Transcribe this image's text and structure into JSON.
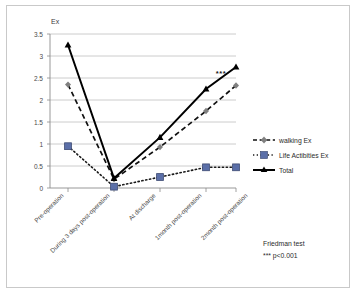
{
  "chart_data": {
    "type": "line",
    "title": "",
    "ylabel": "Ex",
    "xlabel": "",
    "ylim": [
      0,
      3.5
    ],
    "yticks": [
      "0",
      "0.5",
      "1",
      "1.5",
      "2",
      "2.5",
      "3",
      "3.5"
    ],
    "grid": true,
    "legend_position": "right",
    "categories": [
      "Pre-operation",
      "During 3 days post-operation",
      "At discharge",
      "1month post-operation",
      "2month post-operation"
    ],
    "series": [
      {
        "name": "walking Ex",
        "values": [
          2.35,
          0.2,
          0.93,
          1.75,
          2.33
        ],
        "color": "#1a1a1a",
        "marker_color": "#808080",
        "style": "dashed",
        "marker": "diamond"
      },
      {
        "name": "Life Actibities Ex",
        "values": [
          0.95,
          0.03,
          0.25,
          0.47,
          0.47
        ],
        "color": "#1a1a1a",
        "marker_color": "#5b6fa8",
        "style": "dotted",
        "marker": "square"
      },
      {
        "name": "Total",
        "values": [
          3.25,
          0.22,
          1.15,
          2.25,
          2.75
        ],
        "color": "#000000",
        "marker_color": "#000000",
        "style": "solid",
        "marker": "triangle"
      }
    ],
    "annotations": [
      {
        "text": "***",
        "x_between": [
          3,
          4
        ],
        "y": 2.72
      }
    ],
    "notes": [
      "Friedman test",
      "*** p<0.001"
    ]
  },
  "legend": {
    "items": [
      {
        "label": "walking Ex"
      },
      {
        "label": "Life Actibities Ex"
      },
      {
        "label": "Total"
      }
    ]
  },
  "footnote": {
    "line1": "Friedman test",
    "line2": "*** p<0.001"
  },
  "significance": {
    "stars": "***"
  },
  "axis": {
    "y_title": "Ex"
  }
}
